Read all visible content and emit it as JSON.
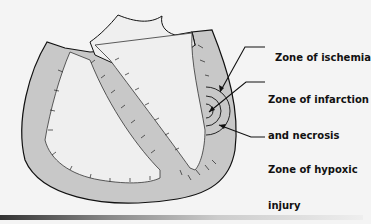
{
  "figure": {
    "labels": {
      "ischemia": "Zone of ischemia",
      "infarction_line1": "Zone of infarction",
      "infarction_line2": "and necrosis",
      "hypoxic_line1": "Zone of hypoxic",
      "hypoxic_line2": "injury"
    }
  },
  "colors": {
    "background": "#f4f4f4",
    "muscle": "#c8c8c8",
    "chamber": "#efefef",
    "outline": "#111111"
  }
}
